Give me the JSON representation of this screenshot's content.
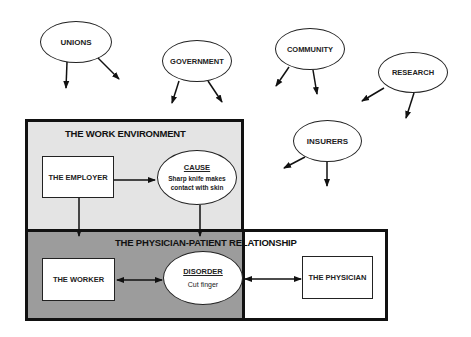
{
  "influencers": [
    {
      "id": "unions",
      "label": "UNIONS"
    },
    {
      "id": "government",
      "label": "GOVERNMENT"
    },
    {
      "id": "community",
      "label": "COMMUNITY"
    },
    {
      "id": "research",
      "label": "RESEARCH"
    },
    {
      "id": "insurers",
      "label": "INSURERS"
    }
  ],
  "work_environment": {
    "title": "THE WORK ENVIRONMENT",
    "employer": "THE EMPLOYER",
    "cause": {
      "heading": "CAUSE",
      "text_line1": "Sharp knife makes",
      "text_line2": "contact with skin"
    }
  },
  "physician_patient": {
    "title": "THE PHYSICIAN-PATIENT RELATIONSHIP",
    "worker": "THE WORKER",
    "disorder": {
      "heading": "DISORDER",
      "text": "Cut finger"
    },
    "physician": "THE PHYSICIAN"
  },
  "colors": {
    "work_environment_fill": "#e4e4e4",
    "physician_patient_fill": "#9c9c9c",
    "line": "#111111"
  }
}
